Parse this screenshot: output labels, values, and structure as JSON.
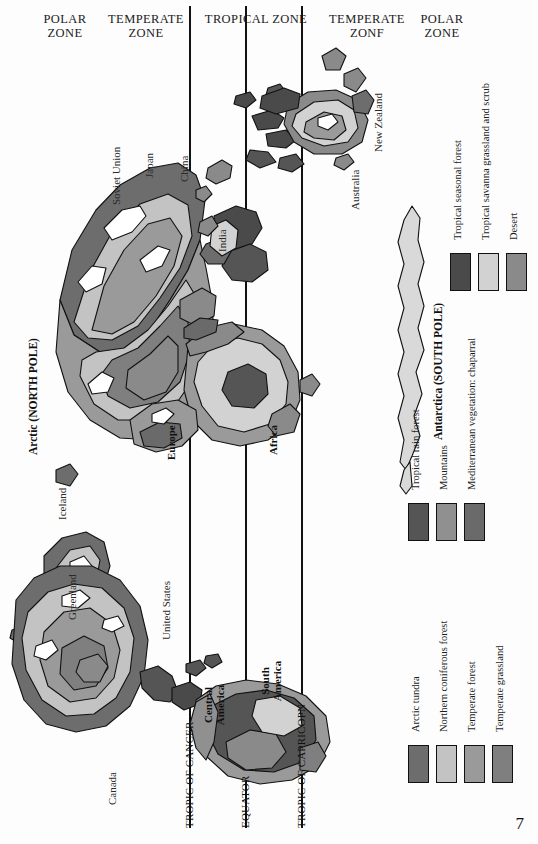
{
  "page": {
    "number": "7"
  },
  "zones": {
    "items": [
      {
        "name": "polar-zone-left",
        "label": "POLAR\nZONE"
      },
      {
        "name": "temperate-zone-left",
        "label": "TEMPERATE\nZONE"
      },
      {
        "name": "tropical-zone",
        "label": "TROPICAL ZONE"
      },
      {
        "name": "temperate-zone-right",
        "label": "TEMPERATE\nZONF"
      },
      {
        "name": "polar-zone-right",
        "label": "POLAR\nZONE"
      }
    ]
  },
  "latitude_lines": [
    {
      "name": "tropic-of-cancer",
      "label": "TROPIC OF CANCER"
    },
    {
      "name": "equator",
      "label": "EQUATOR"
    },
    {
      "name": "tropic-of-capricorn",
      "label": "TROPIC OF CAPRICOPN"
    }
  ],
  "poles": [
    {
      "name": "arctic",
      "label": "Arctic (NORTH POLE)"
    },
    {
      "name": "antarctica",
      "label": "Antarctica (SOUTH POLE)"
    }
  ],
  "continents": [
    {
      "name": "europe",
      "label": "Europe"
    },
    {
      "name": "africa",
      "label": "Africa"
    },
    {
      "name": "central-america",
      "label": "Central\nAmerica"
    },
    {
      "name": "south-america",
      "label": "South\nAmerica"
    }
  ],
  "countries": [
    {
      "name": "soviet-union",
      "label": "Soviet Union"
    },
    {
      "name": "japan",
      "label": "Japan"
    },
    {
      "name": "china",
      "label": "China"
    },
    {
      "name": "india",
      "label": "India"
    },
    {
      "name": "new-zealand",
      "label": "New Zealand"
    },
    {
      "name": "australia",
      "label": "Australia"
    },
    {
      "name": "iceland",
      "label": "Iceland"
    },
    {
      "name": "greenland",
      "label": "Greenland"
    },
    {
      "name": "united-states",
      "label": "United States"
    },
    {
      "name": "canada",
      "label": "Canada"
    }
  ],
  "legend": {
    "groups": [
      {
        "name": "legend-group-temperate",
        "entries": [
          {
            "label": "Arctic tundra",
            "color": "#6d6d6d"
          },
          {
            "label": "Northern coniferous forest",
            "color": "#c3c3c3"
          },
          {
            "label": "Temperate forest",
            "color": "#9a9a9a"
          },
          {
            "label": "Temperate grassland",
            "color": "#7f7f7f"
          }
        ]
      },
      {
        "name": "legend-group-tropical-left",
        "entries": [
          {
            "label": "Tropical rain forest",
            "color": "#555555"
          },
          {
            "label": "Mountains",
            "color": "#909090"
          },
          {
            "label": "Mediterranean vegetation: chaparral",
            "color": "#6a6a6a"
          }
        ]
      },
      {
        "name": "legend-group-tropical-right",
        "entries": [
          {
            "label": "Tropical seasonal forest",
            "color": "#4a4a4a"
          },
          {
            "label": "Tropical savanna grassland and scrub",
            "color": "#d2d2d2"
          },
          {
            "label": "Desert",
            "color": "#8a8a8a"
          }
        ]
      }
    ]
  },
  "colors": {
    "tundra": "#6d6d6d",
    "coniferous": "#c3c3c3",
    "temperate_forest": "#9a9a9a",
    "temperate_grassland": "#7f7f7f",
    "rain_forest": "#555555",
    "mountains": "#909090",
    "chaparral": "#6a6a6a",
    "seasonal_forest": "#4a4a4a",
    "savanna": "#d2d2d2",
    "desert": "#8a8a8a",
    "outline": "#111111",
    "page_bg": "#ffffff"
  }
}
